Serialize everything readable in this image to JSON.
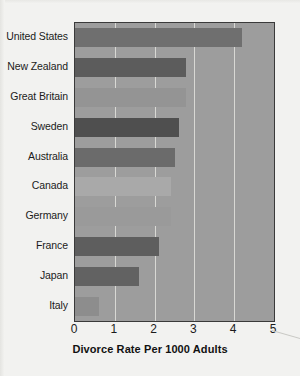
{
  "chart_data": {
    "type": "bar",
    "orientation": "horizontal",
    "title": "",
    "xlabel": "Divorce Rate Per 1000 Adults",
    "ylabel": "",
    "xlim": [
      0,
      5
    ],
    "xticks": [
      "0",
      "1",
      "2",
      "3",
      "4",
      "5"
    ],
    "grid": true,
    "legend": "none",
    "categories": [
      "United States",
      "New Zealand",
      "Great Britain",
      "Sweden",
      "Australia",
      "Canada",
      "Germany",
      "France",
      "Japan",
      "Italy"
    ],
    "values": [
      4.2,
      2.8,
      2.8,
      2.6,
      2.5,
      2.4,
      2.4,
      2.1,
      1.6,
      0.6
    ],
    "bar_colors": [
      "#6f6f6f",
      "#5c5c5c",
      "#949494",
      "#4f4f4f",
      "#6b6b6b",
      "#a9a9a9",
      "#9a9a9a",
      "#5e5e5e",
      "#626262",
      "#8d8d8d"
    ]
  },
  "colors": {
    "plot_background": "#9d9d9d",
    "page_background": "#f2f2f0",
    "gridline": "#d8d8d4",
    "axis_border": "#3a3a3a",
    "text": "#1b1b1b"
  },
  "icons": {
    "scan_artifact": "diagonal-line-artifact"
  }
}
